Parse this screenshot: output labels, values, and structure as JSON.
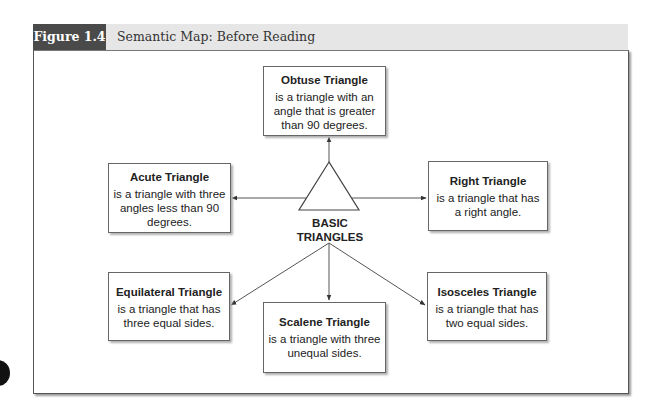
{
  "figure": {
    "label": "Figure 1.4",
    "title": "Semantic Map: Before Reading"
  },
  "center": {
    "line1": "BASIC",
    "line2": "TRIANGLES"
  },
  "nodes": {
    "obtuse": {
      "title": "Obtuse Triangle",
      "desc": "is a triangle with an angle that is greater than 90 degrees."
    },
    "acute": {
      "title": "Acute Triangle",
      "desc": "is a triangle with three angles less than 90 degrees."
    },
    "right": {
      "title": "Right Triangle",
      "desc": "is a triangle that has a right angle."
    },
    "equilateral": {
      "title": "Equilateral Triangle",
      "desc": "is a triangle that has three equal sides."
    },
    "scalene": {
      "title": "Scalene Triangle",
      "desc": "is a triangle with three unequal sides."
    },
    "isosceles": {
      "title": "Isosceles Triangle",
      "desc": "is a triangle that has two equal sides."
    }
  },
  "colors": {
    "label_bg": "#4a4a4a",
    "header_bg": "#e6e6e6",
    "line": "#555555"
  }
}
